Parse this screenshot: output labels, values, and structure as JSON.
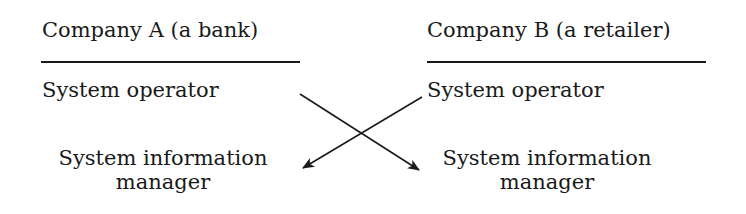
{
  "columns": [
    {
      "header": "Company A (a bank)",
      "roles": [
        "System operator",
        "System information manager"
      ],
      "role_lines": {
        "sim_line1": "System information",
        "sim_line2": "manager"
      }
    },
    {
      "header": "Company B (a retailer)",
      "roles": [
        "System operator",
        "System information manager"
      ],
      "role_lines": {
        "sim_line1": "System information",
        "sim_line2": "manager"
      }
    }
  ],
  "arrows": [
    {
      "from": "Company A System operator",
      "to": "Company B System information manager"
    },
    {
      "from": "Company B System operator",
      "to": "Company A System information manager"
    }
  ]
}
